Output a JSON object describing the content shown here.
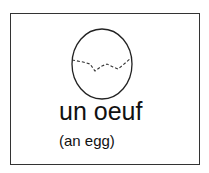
{
  "card": {
    "word": "un oeuf",
    "translation": "(an egg)",
    "illustration": "egg-icon"
  },
  "colors": {
    "border": "#333333",
    "text": "#111111",
    "background": "#ffffff"
  }
}
